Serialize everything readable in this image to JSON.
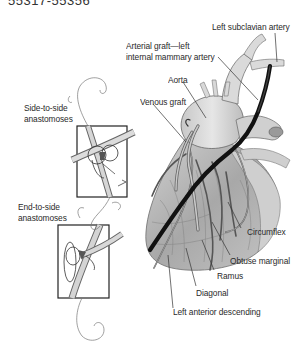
{
  "figure": {
    "top_code": "55317-55356"
  },
  "labels": {
    "left_subclavian": "Left subclavian artery",
    "arterial_graft_line1": "Arterial graft—left",
    "arterial_graft_line2": "internal mammary artery",
    "aorta": "Aorta",
    "venous_graft": "Venous graft",
    "side_to_side_line1": "Side-to-side",
    "side_to_side_line2": "anastomoses",
    "end_to_side_line1": "End-to-side",
    "end_to_side_line2": "anastomoses",
    "circumflex": "Circumflex",
    "obtuse_marginal": "Obtuse marginal",
    "ramus": "Ramus",
    "diagonal": "Diagonal",
    "lad": "Left anterior descending"
  },
  "colors": {
    "text": "#2a2a2a",
    "graft": "#1a1a1a",
    "heart_fill": "#b9b9b9",
    "heart_shadow": "#8e8e8e",
    "vessel_fill": "#d6d6d6",
    "leader": "#333333"
  }
}
